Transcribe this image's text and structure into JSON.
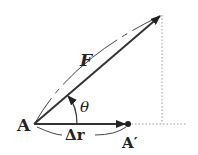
{
  "diagram": {
    "labels": {
      "force": "F",
      "angle": "θ",
      "displacement": "Δr",
      "start_point": "A",
      "end_point": "A′"
    },
    "colors": {
      "stroke": "#333333",
      "dotted": "#999999"
    }
  }
}
